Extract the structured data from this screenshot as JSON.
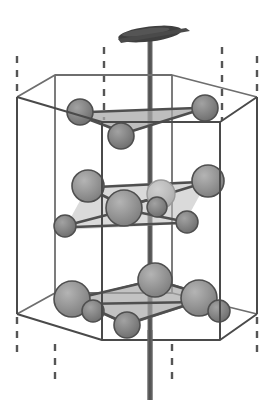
{
  "figure": {
    "title": "Hexagonal unit cell crystal structure",
    "type": "crystal-structure-diagram",
    "width": 274,
    "height": 411,
    "background_color": "#ffffff"
  },
  "colors": {
    "outline": "#4a4a4a",
    "outline_light": "#6e6e6e",
    "dashed": "#555555",
    "axis_rod": "#5a5a5a",
    "axis_cap": "#3a3a3a",
    "atom_fill": "#8f8f8f",
    "atom_fill_dark": "#7a7a7a",
    "atom_fill_faded": "#b3b3b3",
    "atom_stroke": "#4f4f4f",
    "plane_fill": "#a8a8a8",
    "plane_fill_light": "#bcbcbc",
    "bond": "#4f4f4f"
  },
  "axis": {
    "name": "c-axis",
    "label": "",
    "x": 150,
    "top_y": 36,
    "bottom_y": 400,
    "width": 5,
    "cap": {
      "name": "axis-cap-disc",
      "cx": 150,
      "cy": 34,
      "rx": 32,
      "ry": 7,
      "rotation": -7
    }
  },
  "prism": {
    "name": "hexagonal-prism",
    "top_hexagon": [
      [
        17,
        97
      ],
      [
        55,
        75
      ],
      [
        172,
        75
      ],
      [
        257,
        97
      ],
      [
        220,
        122
      ],
      [
        102,
        122
      ]
    ],
    "bottom_hexagon": [
      [
        17,
        314
      ],
      [
        55,
        293
      ],
      [
        172,
        293
      ],
      [
        257,
        314
      ],
      [
        220,
        340
      ],
      [
        102,
        340
      ]
    ],
    "vertical_edges": [
      [
        17,
        97,
        17,
        314
      ],
      [
        55,
        75,
        55,
        293
      ],
      [
        172,
        75,
        172,
        293
      ],
      [
        257,
        97,
        257,
        314
      ],
      [
        220,
        122,
        220,
        340
      ],
      [
        102,
        122,
        102,
        340
      ]
    ],
    "dashed_extensions_top": [
      [
        17,
        56,
        17,
        94
      ],
      [
        104,
        47,
        104,
        120
      ],
      [
        222,
        47,
        222,
        120
      ],
      [
        257,
        56,
        257,
        94
      ]
    ],
    "dashed_extensions_bottom": [
      [
        17,
        317,
        17,
        356
      ],
      [
        55,
        340,
        55,
        382
      ],
      [
        172,
        340,
        172,
        382
      ],
      [
        257,
        317,
        257,
        356
      ]
    ]
  },
  "layers": [
    {
      "name": "top-layer",
      "plane": {
        "name": "top-triangle-plane",
        "points": "78,113 205,107 120,137",
        "fill": "#a8a8a8",
        "opacity": 0.75
      },
      "bonds": [
        [
          78,
          113,
          205,
          107
        ],
        [
          78,
          113,
          120,
          137
        ],
        [
          120,
          137,
          205,
          107
        ]
      ],
      "atoms": [
        {
          "name": "atom-top-left",
          "cx": 80,
          "cy": 112,
          "r": 13,
          "shade": "dark"
        },
        {
          "name": "atom-top-right",
          "cx": 205,
          "cy": 108,
          "r": 13,
          "shade": "dark"
        },
        {
          "name": "atom-top-front",
          "cx": 121,
          "cy": 136,
          "r": 13,
          "shade": "dark"
        }
      ]
    },
    {
      "name": "middle-layer",
      "plane": {
        "name": "middle-rhombus-plane",
        "points": "88,186 208,180 184,222 64,228",
        "fill": "#bcbcbc",
        "opacity": 0.55
      },
      "bonds": [
        [
          88,
          187,
          208,
          181
        ],
        [
          88,
          187,
          124,
          209
        ],
        [
          124,
          209,
          208,
          181
        ],
        [
          124,
          209,
          66,
          226
        ],
        [
          124,
          209,
          186,
          222
        ],
        [
          124,
          209,
          160,
          196
        ]
      ],
      "atoms": [
        {
          "name": "atom-mid-back-left",
          "cx": 88,
          "cy": 186,
          "r": 16,
          "shade": "normal"
        },
        {
          "name": "atom-mid-back-right",
          "cx": 208,
          "cy": 181,
          "r": 16,
          "shade": "normal"
        },
        {
          "name": "atom-mid-hidden",
          "cx": 161,
          "cy": 194,
          "r": 14,
          "shade": "faded"
        },
        {
          "name": "atom-mid-center",
          "cx": 124,
          "cy": 208,
          "r": 18,
          "shade": "normal"
        },
        {
          "name": "atom-mid-overlap",
          "cx": 157,
          "cy": 207,
          "r": 10,
          "shade": "dark"
        },
        {
          "name": "atom-mid-front-left",
          "cx": 65,
          "cy": 226,
          "r": 11,
          "shade": "dark"
        },
        {
          "name": "atom-mid-front-right",
          "cx": 187,
          "cy": 222,
          "r": 11,
          "shade": "dark"
        }
      ]
    },
    {
      "name": "bottom-layer",
      "plane": {
        "name": "bottom-rhombus-plane",
        "points": "155,279 214,297 127,325 72,300",
        "fill": "#a8a8a8",
        "opacity": 0.7
      },
      "bonds": [
        [
          155,
          280,
          214,
          297
        ],
        [
          72,
          300,
          155,
          280
        ],
        [
          72,
          300,
          127,
          324
        ],
        [
          127,
          324,
          214,
          297
        ],
        [
          72,
          300,
          214,
          297
        ]
      ],
      "atoms": [
        {
          "name": "atom-bot-back",
          "cx": 155,
          "cy": 280,
          "r": 17,
          "shade": "normal"
        },
        {
          "name": "atom-bot-left-large",
          "cx": 72,
          "cy": 299,
          "r": 18,
          "shade": "normal"
        },
        {
          "name": "atom-bot-left-small",
          "cx": 93,
          "cy": 311,
          "r": 11,
          "shade": "dark"
        },
        {
          "name": "atom-bot-right-large",
          "cx": 199,
          "cy": 298,
          "r": 18,
          "shade": "normal"
        },
        {
          "name": "atom-bot-right-small",
          "cx": 219,
          "cy": 311,
          "r": 11,
          "shade": "dark"
        },
        {
          "name": "atom-bot-front",
          "cx": 127,
          "cy": 325,
          "r": 13,
          "shade": "dark"
        }
      ]
    }
  ]
}
